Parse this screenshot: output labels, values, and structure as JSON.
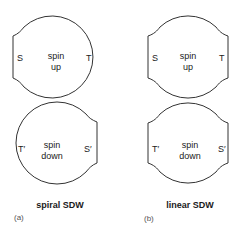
{
  "panels": [
    {
      "id": "a",
      "label": "(a)",
      "caption": "spiral SDW",
      "top": {
        "center": [
          "spin",
          "up"
        ],
        "left": "S",
        "right": "T"
      },
      "bottom": {
        "center": [
          "spin",
          "down"
        ],
        "left": "T′",
        "right": "S′"
      }
    },
    {
      "id": "b",
      "label": "(b)",
      "caption": "linear SDW",
      "top": {
        "center": [
          "spin",
          "up"
        ],
        "left": "S",
        "right": "T"
      },
      "bottom": {
        "center": [
          "spin",
          "down"
        ],
        "left": "T′",
        "right": "S′"
      }
    }
  ],
  "colors": {
    "line": "#333333",
    "text": "#1a1a1a"
  }
}
